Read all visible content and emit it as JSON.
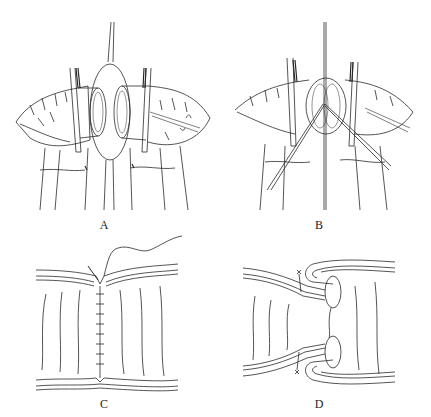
{
  "figure": {
    "panels": [
      {
        "id": "A",
        "label": "A",
        "description": "Two bowel ends held by clamps, approximated with stay suture loop"
      },
      {
        "id": "B",
        "label": "B",
        "description": "Bowel ends brought together with crossing stay sutures"
      },
      {
        "id": "C",
        "label": "C",
        "description": "Continuous suture closing the anastomosis, longitudinal section"
      },
      {
        "id": "D",
        "label": "D",
        "description": "Inverted (invaginated) anastomosis with layered sutures, longitudinal section"
      }
    ],
    "colors": {
      "line": "#2a2a2a",
      "background": "#ffffff"
    }
  }
}
